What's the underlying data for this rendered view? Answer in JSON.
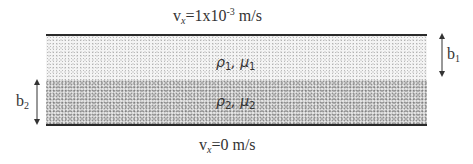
{
  "diagram": {
    "type": "two-layer fluid flow between plates",
    "top_boundary": {
      "velocity_symbol": "v",
      "velocity_subscript": "x",
      "velocity_value": "=1x10",
      "velocity_exponent": "-3",
      "velocity_unit": " m/s"
    },
    "bottom_boundary": {
      "velocity_symbol": "v",
      "velocity_subscript": "x",
      "velocity_value": "=0 m/s"
    },
    "layers": [
      {
        "position": "upper",
        "density_symbol": "ρ",
        "density_index": "1",
        "separator": ", ",
        "viscosity_symbol": "μ",
        "viscosity_index": "1",
        "shade": "light stipple"
      },
      {
        "position": "lower",
        "density_symbol": "ρ",
        "density_index": "2",
        "separator": ", ",
        "viscosity_symbol": "μ",
        "viscosity_index": "2",
        "shade": "dark stipple"
      }
    ],
    "dimensions": {
      "b1": {
        "symbol": "b",
        "index": "1",
        "side": "right",
        "spans": "upper layer"
      },
      "b2": {
        "symbol": "b",
        "index": "2",
        "side": "left",
        "spans": "lower layer"
      }
    },
    "colors": {
      "wall": "#2a2a2a",
      "text": "#333333",
      "upper_fill": "#f4f4f4",
      "lower_fill": "#e4e4e4"
    }
  }
}
